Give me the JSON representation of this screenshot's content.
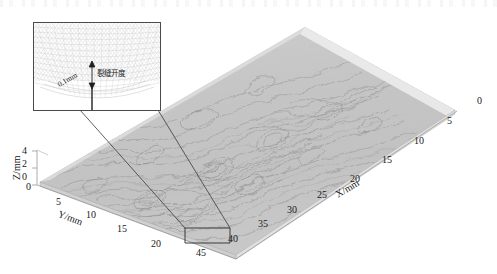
{
  "figure": {
    "kind": "3d-surface-plot"
  },
  "axes": {
    "x": {
      "label": "X/mm",
      "ticks": [
        "0",
        "5",
        "10",
        "15",
        "20",
        "25",
        "30",
        "35",
        "40",
        "45"
      ],
      "range": [
        0,
        45
      ]
    },
    "y": {
      "label": "Y/mm",
      "ticks": [
        "0",
        "5",
        "10",
        "15",
        "20"
      ],
      "range": [
        0,
        20
      ]
    },
    "z": {
      "label": "Z/mm",
      "ticks": [
        "4",
        "2",
        "0"
      ],
      "range": [
        0,
        4
      ]
    }
  },
  "inset": {
    "aperture_label": "裂缝开度",
    "dimension_label": "0.1mm"
  },
  "colors": {
    "surface_light": "#d9d9d9",
    "surface_mid": "#a8a8a8",
    "surface_dark": "#777777",
    "axis_line": "#9a9a9a",
    "text": "#1a1a1a",
    "inset_border": "#4a4a4a",
    "leader_line": "#3a3a3a"
  }
}
